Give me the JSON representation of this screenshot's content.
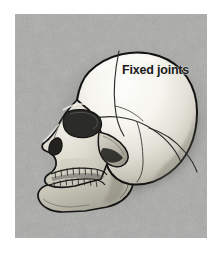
{
  "figure": {
    "background_color": "#ffffff",
    "panel_color": "#a9a9a7",
    "bone_color": "#f2f1ec",
    "outline_color": "#121212"
  },
  "labels": [
    {
      "id": "fixed-joints",
      "text": "Fixed joints",
      "color": "#1b1b1b",
      "weight": "bold",
      "points_to": "cranial-sutures"
    }
  ],
  "anatomy": {
    "regions": [
      "frontal-bone",
      "parietal-bone",
      "occipital-bone",
      "temporal-bone",
      "sphenoid-bone",
      "nasal-bone",
      "zygomatic-arch",
      "maxilla",
      "mandible",
      "orbit",
      "nasal-aperture",
      "upper-teeth",
      "lower-teeth"
    ],
    "sutures": [
      "coronal-suture",
      "squamous-suture",
      "lambdoid-suture"
    ]
  }
}
